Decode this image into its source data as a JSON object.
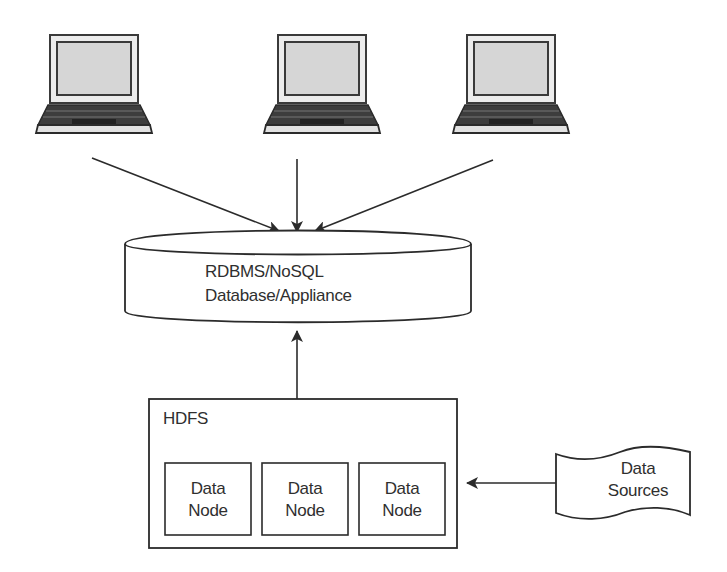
{
  "diagram": {
    "clients": [
      {
        "icon": "laptop-icon",
        "label": ""
      },
      {
        "icon": "laptop-icon",
        "label": ""
      },
      {
        "icon": "laptop-icon",
        "label": ""
      }
    ],
    "database": {
      "line1": "RDBMS/NoSQL",
      "line2": "Database/Appliance"
    },
    "hdfs": {
      "title": "HDFS",
      "nodes": [
        {
          "line1": "Data",
          "line2": "Node"
        },
        {
          "line1": "Data",
          "line2": "Node"
        },
        {
          "line1": "Data",
          "line2": "Node"
        }
      ]
    },
    "data_sources": {
      "line1": "Data",
      "line2": "Sources"
    },
    "edges": [
      {
        "from": "laptop-1",
        "to": "database"
      },
      {
        "from": "laptop-2",
        "to": "database"
      },
      {
        "from": "laptop-3",
        "to": "database"
      },
      {
        "from": "hdfs",
        "to": "database"
      },
      {
        "from": "data-sources",
        "to": "hdfs"
      }
    ],
    "colors": {
      "stroke": "#2b2b2b",
      "screen": "#d9d9d9",
      "background": "#ffffff"
    }
  }
}
